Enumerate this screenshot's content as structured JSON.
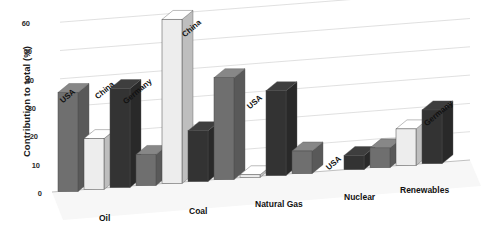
{
  "chart_data": {
    "type": "bar",
    "title": "",
    "subtitle": "",
    "xlabel": "",
    "ylabel": "Contribution to total (%)",
    "ylim": [
      0,
      60
    ],
    "yticks": [
      0,
      10,
      20,
      30,
      40,
      50,
      60
    ],
    "ytick_labels": [
      "0",
      "10",
      "20",
      "30",
      "40",
      "50",
      "60"
    ],
    "grid": true,
    "legend": "none (series labelled above bars)",
    "style": "3D grayscale bars on receding floor plane",
    "categories": [
      "Oil",
      "Coal",
      "Natural Gas",
      "Nuclear",
      "Renewables"
    ],
    "series": [
      {
        "name": "USA",
        "color": "#6f6f6f",
        "values": [
          35,
          11,
          36,
          8,
          7
        ]
      },
      {
        "name": "China",
        "color": "#ededed",
        "values": [
          18,
          58,
          1,
          0,
          13
        ]
      },
      {
        "name": "Germany",
        "color": "#333333",
        "values": [
          35,
          18,
          30,
          5,
          19
        ]
      }
    ],
    "series_labels_shown": [
      "USA",
      "China",
      "Germany",
      "China",
      "USA",
      "USA",
      "Germany"
    ],
    "annotations": []
  },
  "axis": {
    "y_title": "Contribution to total (%)",
    "ticks": [
      {
        "value": "60",
        "x": 30,
        "y": 19
      },
      {
        "value": "50",
        "x": 32,
        "y": 47
      },
      {
        "value": "40",
        "x": 34,
        "y": 76
      },
      {
        "value": "30",
        "x": 36,
        "y": 104
      },
      {
        "value": "20",
        "x": 38,
        "y": 132
      },
      {
        "value": "10",
        "x": 40,
        "y": 161
      },
      {
        "value": "0",
        "x": 42,
        "y": 189
      }
    ]
  },
  "series_labels": [
    {
      "text": "USA",
      "x": 64,
      "y": 96
    },
    {
      "text": "China",
      "x": 99,
      "y": 92
    },
    {
      "text": "Germany",
      "x": 127,
      "y": 97
    },
    {
      "text": "China",
      "x": 186,
      "y": 30
    },
    {
      "text": "USA",
      "x": 251,
      "y": 102
    },
    {
      "text": "USA",
      "x": 330,
      "y": 163
    },
    {
      "text": "Germany",
      "x": 428,
      "y": 119
    }
  ],
  "category_labels": [
    {
      "text": "Oil",
      "x": 99,
      "y": 213
    },
    {
      "text": "Coal",
      "x": 189,
      "y": 206
    },
    {
      "text": "Natural Gas",
      "x": 255,
      "y": 199
    },
    {
      "text": "Nuclear",
      "x": 344,
      "y": 192
    },
    {
      "text": "Renewables",
      "x": 400,
      "y": 185
    }
  ]
}
